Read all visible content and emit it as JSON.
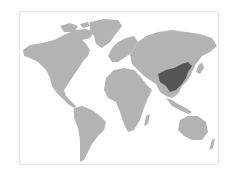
{
  "map": {
    "type": "world-locator-map",
    "highlighted_region": "China",
    "colors": {
      "land": "#b3b3b3",
      "highlight": "#555555",
      "ocean": "#ffffff",
      "border": "#e4e4e4"
    }
  }
}
